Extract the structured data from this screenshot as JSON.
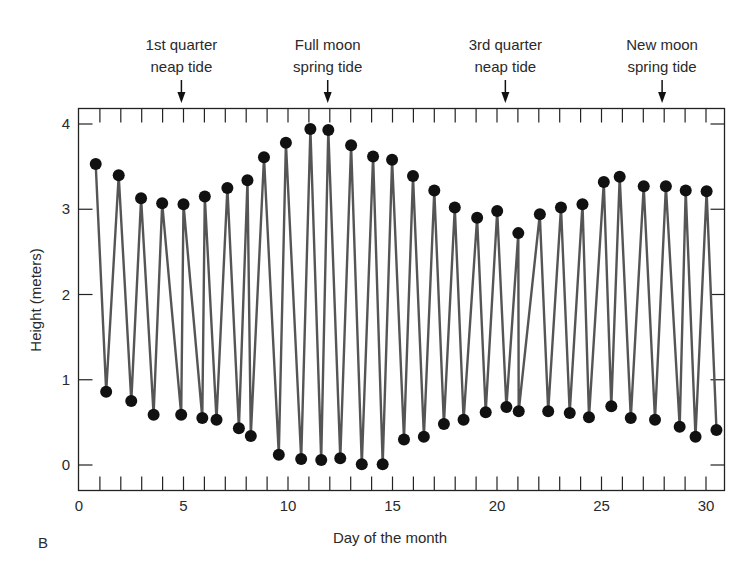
{
  "chart_data": {
    "type": "line",
    "panel_label": "B",
    "xlabel": "Day of the month",
    "ylabel": "Height (meters)",
    "xlim": [
      0,
      30.8
    ],
    "ylim": [
      -0.3,
      4.2
    ],
    "x_ticks": [
      0,
      5,
      10,
      15,
      20,
      25,
      30
    ],
    "y_ticks": [
      0,
      1,
      2,
      3,
      4
    ],
    "grid": false,
    "minor_x_ticks_every": 1,
    "annotations": [
      {
        "line1": "1st quarter",
        "line2": "neap tide",
        "x": 4.9
      },
      {
        "line1": "Full moon",
        "line2": "spring tide",
        "x": 11.9
      },
      {
        "line1": "3rd quarter",
        "line2": "neap tide",
        "x": 20.4
      },
      {
        "line1": "New moon",
        "line2": "spring tide",
        "x": 27.9
      }
    ],
    "series": [
      {
        "name": "Tide height (alternating high/low tides)",
        "marker": "filled-circle",
        "x": [
          0.8,
          1.3,
          1.9,
          2.5,
          2.97,
          3.57,
          3.98,
          4.89,
          5.0,
          5.9,
          6.02,
          6.58,
          7.1,
          7.65,
          8.06,
          8.22,
          8.85,
          9.56,
          9.9,
          10.63,
          11.07,
          11.59,
          11.93,
          12.5,
          13.02,
          13.53,
          14.07,
          14.53,
          14.98,
          15.55,
          15.98,
          16.5,
          17.0,
          17.46,
          17.98,
          18.4,
          19.05,
          19.46,
          20.01,
          20.45,
          21.02,
          21.04,
          22.05,
          22.45,
          23.06,
          23.48,
          24.09,
          24.4,
          25.11,
          25.47,
          25.87,
          26.4,
          27.02,
          27.56,
          28.08,
          28.74,
          29.03,
          29.5,
          30.03,
          30.5
        ],
        "y": [
          3.53,
          0.86,
          3.4,
          0.75,
          3.13,
          0.59,
          3.07,
          0.59,
          3.06,
          0.55,
          3.15,
          0.53,
          3.25,
          0.43,
          3.34,
          0.34,
          3.61,
          0.12,
          3.78,
          0.07,
          3.94,
          0.06,
          3.93,
          0.08,
          3.75,
          0.01,
          3.62,
          0.01,
          3.58,
          0.3,
          3.39,
          0.33,
          3.22,
          0.48,
          3.02,
          0.53,
          2.9,
          0.62,
          2.98,
          0.68,
          2.72,
          0.63,
          2.94,
          0.63,
          3.02,
          0.61,
          3.06,
          0.56,
          3.32,
          0.69,
          3.38,
          0.55,
          3.27,
          0.53,
          3.27,
          0.45,
          3.22,
          0.33,
          3.21,
          0.41
        ]
      }
    ]
  },
  "colors": {
    "line": "#555555",
    "marker": "#111111",
    "axis": "#222222",
    "text": "#2a2a2a"
  }
}
